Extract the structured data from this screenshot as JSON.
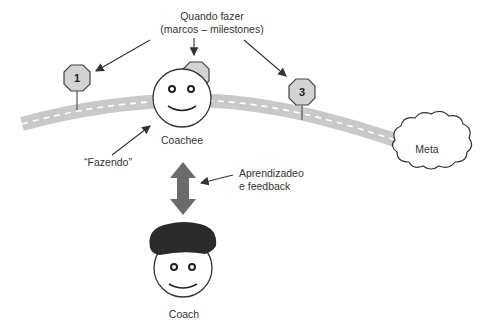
{
  "diagram": {
    "labels": {
      "when_line1": "Quando fazer",
      "when_line2": "(marcos – milestones)",
      "doing": "“Fazendo”",
      "learning_line1": "Aprendizadeo",
      "learning_line2": "e feedback",
      "coachee": "Coachee",
      "coach": "Coach",
      "goal": "Meta"
    },
    "milestones": [
      {
        "label": "1"
      },
      {
        "label": "2"
      },
      {
        "label": "3"
      }
    ],
    "colors": {
      "road": "#c9c9c9",
      "road_dash": "#ffffff",
      "sign_fill": "#d3d3d3",
      "arrow": "#666666",
      "hair": "#2b2b2b",
      "outline": "#333333"
    }
  }
}
